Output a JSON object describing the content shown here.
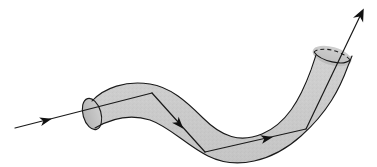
{
  "figure": {
    "title": "Curved tube with threaded directed path",
    "type": "line-diagram",
    "width": 377,
    "height": 167,
    "background_color": "#ffffff",
    "stroke_color": "#1a1a1a",
    "tube_fill_color": "#cbcbcb",
    "tube_fill_color_dark": "#bdbdbd",
    "cap_fill_color": "#c2c2c2",
    "stroke_width": 1.1,
    "path_stroke_width": 1.2,
    "dash_pattern": "4 3",
    "labels": []
  },
  "elements": {
    "tube": {
      "name": "curved-tube-surface",
      "description": "S-curved solid tube, open at lower-left end and upper-right end",
      "outline_top": "M 92 101 C 104 88, 126 80, 150 84 C 170 87, 186 101, 203 118 C 222 137, 240 143, 262 134 C 286 124, 300 100, 311 70 L 316 55",
      "outline_bottom": "M 95 128 C 112 118, 131 114, 150 120 C 170 127, 186 145, 208 156 C 236 170, 272 162, 301 136 C 328 112, 340 88, 348 66 L 352 56"
    },
    "left_cap": {
      "name": "tube-open-end-left",
      "center_x": 92,
      "center_y": 114,
      "radius_x": 9,
      "radius_y": 16,
      "rotation_deg": -16
    },
    "right_cap": {
      "name": "tube-open-end-right",
      "center_x": 332,
      "center_y": 56,
      "radius_x": 20,
      "radius_y": 9,
      "rotation_deg": 16
    },
    "threaded_path": {
      "name": "directed-path-through-tube",
      "vertices": [
        {
          "x": 15,
          "y": 128
        },
        {
          "x": 152,
          "y": 93
        },
        {
          "x": 205,
          "y": 152
        },
        {
          "x": 306,
          "y": 129
        },
        {
          "x": 362,
          "y": 12
        }
      ],
      "arrowheads": [
        {
          "name": "arrowhead-entry",
          "x": 47,
          "y": 120,
          "angle_deg": -14
        },
        {
          "name": "arrowhead-descending",
          "x": 180,
          "y": 125,
          "angle_deg": 48
        },
        {
          "name": "arrowhead-ascending",
          "x": 268,
          "y": 138,
          "angle_deg": -13
        },
        {
          "name": "arrowhead-exit",
          "x": 362,
          "y": 12,
          "angle_deg": -64
        }
      ]
    }
  }
}
